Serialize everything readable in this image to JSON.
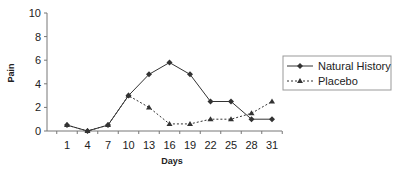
{
  "chart_data": {
    "type": "line",
    "title": "",
    "xlabel": "Days",
    "ylabel": "Pain",
    "ylim": [
      0,
      10
    ],
    "yticks": [
      0,
      2,
      4,
      6,
      8,
      10
    ],
    "categories": [
      "1",
      "4",
      "7",
      "10",
      "13",
      "16",
      "19",
      "22",
      "25",
      "28",
      "31"
    ],
    "series": [
      {
        "name": "Natural History",
        "line_style": "solid",
        "marker": "diamond",
        "values": [
          0.5,
          0,
          0.5,
          3.0,
          4.8,
          5.8,
          4.8,
          2.5,
          2.5,
          1.0,
          1.0
        ]
      },
      {
        "name": "Placebo",
        "line_style": "dotted",
        "marker": "triangle",
        "values": [
          0.5,
          0,
          0.5,
          3.0,
          2.0,
          0.6,
          0.6,
          1.0,
          1.0,
          1.5,
          2.5
        ]
      }
    ],
    "grid": false,
    "legend_position": "right"
  },
  "colors": {
    "line": "#333333",
    "axis": "#777777",
    "legend_border": "#999999"
  }
}
